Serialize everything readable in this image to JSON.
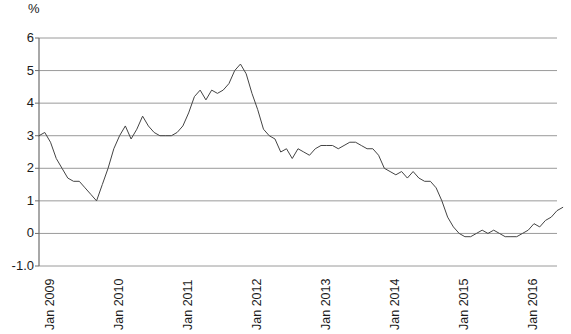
{
  "chart_data": {
    "type": "line",
    "title": "",
    "subtitle": "",
    "xlabel": "",
    "ylabel": "%",
    "unit_label": "%",
    "grid": true,
    "legend": "none",
    "line_color": "#444444",
    "grid_color": "#9a9a9a",
    "axis_color": "#6e6e6e",
    "background_color": "#ffffff",
    "ylim": [
      -1.0,
      6.0
    ],
    "ytick_labels": [
      "6",
      "5",
      "4",
      "3",
      "2",
      "1",
      "0",
      "-1.0"
    ],
    "ytick_values": [
      6,
      5,
      4,
      3,
      2,
      1,
      0,
      -1
    ],
    "xtick_labels": [
      "Jan 2009",
      "Jan 2010",
      "Jan 2011",
      "Jan 2012",
      "Jan 2013",
      "Jan 2014",
      "Jan 2015",
      "Jan 2016"
    ],
    "xtick_values": [
      0,
      12,
      24,
      36,
      48,
      60,
      72,
      84
    ],
    "xlim": [
      0,
      90
    ],
    "x_start_label": "Jan 2009",
    "x_end_label": "Jul 2016",
    "series": [
      {
        "name": "Inflation rate",
        "values": [
          3.0,
          3.1,
          2.8,
          2.3,
          2.0,
          1.7,
          1.6,
          1.6,
          1.4,
          1.2,
          1.0,
          1.5,
          2.0,
          2.6,
          3.0,
          3.3,
          2.9,
          3.2,
          3.6,
          3.3,
          3.1,
          3.0,
          3.0,
          3.0,
          3.1,
          3.3,
          3.7,
          4.2,
          4.4,
          4.1,
          4.4,
          4.3,
          4.4,
          4.6,
          5.0,
          5.2,
          4.9,
          4.3,
          3.8,
          3.2,
          3.0,
          2.9,
          2.5,
          2.6,
          2.3,
          2.6,
          2.5,
          2.4,
          2.6,
          2.7,
          2.7,
          2.7,
          2.6,
          2.7,
          2.8,
          2.8,
          2.7,
          2.6,
          2.6,
          2.4,
          2.0,
          1.9,
          1.8,
          1.9,
          1.7,
          1.9,
          1.7,
          1.6,
          1.6,
          1.4,
          1.0,
          0.5,
          0.2,
          0.0,
          -0.1,
          -0.1,
          0.0,
          0.1,
          0.0,
          0.1,
          0.0,
          -0.1,
          -0.1,
          -0.1,
          0.0,
          0.1,
          0.3,
          0.2,
          0.4,
          0.5,
          0.7,
          0.8
        ]
      }
    ]
  },
  "geometry": {
    "plot_left": 39,
    "plot_right": 557,
    "plot_top": 38,
    "plot_bottom": 266
  }
}
